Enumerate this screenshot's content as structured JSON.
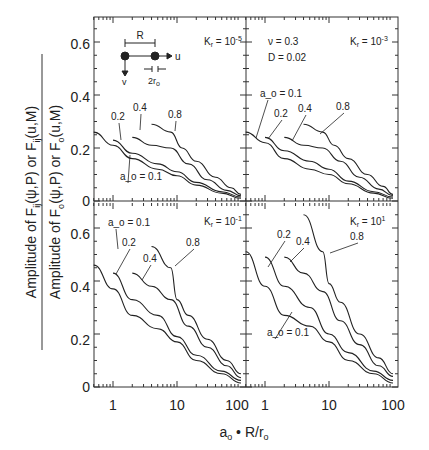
{
  "chart_data": {
    "type": "line",
    "title": "",
    "xlabel": "a_o · R/r_o",
    "ylabel_numerator": "Amplitude of F^v_ij(ψ,P) or F^v_ij(u,M)",
    "ylabel_denominator": "Amplitude of F_o(ψ,P) or F_o(u,M)",
    "x_scale": "log",
    "xlim": [
      0.5,
      100
    ],
    "ylim": [
      0,
      0.7
    ],
    "x_ticks": [
      "1",
      "10",
      "100"
    ],
    "y_ticks": [
      "0",
      "0.2",
      "0.4",
      "0.6"
    ],
    "grid": false,
    "parameters": {
      "nu": "ν = 0.3",
      "D": "D = 0.02"
    },
    "inset": {
      "R": "R",
      "u": "u",
      "v": "v",
      "r": "2r_o"
    },
    "panels": [
      {
        "label": "K_r = 10^-5",
        "series": [
          {
            "name": "a_o = 0.1",
            "x": [
              0.5,
              1,
              2,
              5,
              10,
              20,
              50,
              100
            ],
            "values": [
              0.26,
              0.21,
              0.16,
              0.12,
              0.095,
              0.06,
              0.03,
              0.01
            ]
          },
          {
            "name": "0.2",
            "x": [
              1,
              2,
              5,
              10,
              20,
              50,
              100
            ],
            "values": [
              0.23,
              0.18,
              0.14,
              0.11,
              0.07,
              0.035,
              0.015
            ]
          },
          {
            "name": "0.4",
            "x": [
              2,
              4,
              8,
              15,
              30,
              60,
              100
            ],
            "values": [
              0.24,
              0.21,
              0.2,
              0.14,
              0.08,
              0.04,
              0.02
            ]
          },
          {
            "name": "0.8",
            "x": [
              4,
              8,
              12,
              20,
              40,
              70,
              100
            ],
            "values": [
              0.29,
              0.26,
              0.2,
              0.15,
              0.09,
              0.05,
              0.025
            ]
          }
        ]
      },
      {
        "label": "K_r = 10^-3",
        "series": [
          {
            "name": "a_o = 0.1",
            "x": [
              0.5,
              1,
              2,
              5,
              10,
              20,
              50,
              100
            ],
            "values": [
              0.26,
              0.22,
              0.16,
              0.12,
              0.1,
              0.065,
              0.03,
              0.01
            ]
          },
          {
            "name": "0.2",
            "x": [
              1,
              2,
              5,
              10,
              20,
              50,
              100
            ],
            "values": [
              0.24,
              0.19,
              0.15,
              0.12,
              0.075,
              0.035,
              0.015
            ]
          },
          {
            "name": "0.4",
            "x": [
              2,
              4,
              8,
              15,
              30,
              60,
              100
            ],
            "values": [
              0.24,
              0.21,
              0.2,
              0.15,
              0.09,
              0.045,
              0.02
            ]
          },
          {
            "name": "0.8",
            "x": [
              4,
              8,
              12,
              20,
              40,
              70,
              100
            ],
            "values": [
              0.29,
              0.26,
              0.21,
              0.16,
              0.1,
              0.055,
              0.025
            ]
          }
        ]
      },
      {
        "label": "K_r = 10^-1",
        "series": [
          {
            "name": "a_o = 0.1",
            "x": [
              0.5,
              1,
              2,
              5,
              10,
              20,
              50,
              100
            ],
            "values": [
              0.46,
              0.37,
              0.27,
              0.22,
              0.17,
              0.1,
              0.05,
              0.015
            ]
          },
          {
            "name": "0.2",
            "x": [
              1,
              2,
              5,
              10,
              20,
              50,
              100
            ],
            "values": [
              0.43,
              0.33,
              0.27,
              0.19,
              0.12,
              0.06,
              0.025
            ]
          },
          {
            "name": "0.4",
            "x": [
              2,
              4,
              8,
              15,
              30,
              60,
              100
            ],
            "values": [
              0.43,
              0.38,
              0.33,
              0.23,
              0.15,
              0.08,
              0.035
            ]
          },
          {
            "name": "0.8",
            "x": [
              4,
              8,
              10,
              15,
              30,
              60,
              100
            ],
            "values": [
              0.53,
              0.45,
              0.33,
              0.27,
              0.18,
              0.1,
              0.05
            ]
          }
        ]
      },
      {
        "label": "K_r = 10^1",
        "series": [
          {
            "name": "a_o = 0.1",
            "x": [
              0.5,
              1,
              2,
              5,
              10,
              20,
              50,
              100
            ],
            "values": [
              0.51,
              0.38,
              0.27,
              0.23,
              0.17,
              0.1,
              0.05,
              0.015
            ]
          },
          {
            "name": "0.2",
            "x": [
              1,
              2,
              5,
              10,
              20,
              50,
              100
            ],
            "values": [
              0.49,
              0.38,
              0.3,
              0.2,
              0.13,
              0.06,
              0.025
            ]
          },
          {
            "name": "0.4",
            "x": [
              2,
              4,
              8,
              15,
              30,
              60,
              100
            ],
            "values": [
              0.49,
              0.43,
              0.36,
              0.25,
              0.16,
              0.08,
              0.04
            ]
          },
          {
            "name": "0.8",
            "x": [
              4,
              8,
              10,
              15,
              30,
              60,
              100
            ],
            "values": [
              0.65,
              0.51,
              0.39,
              0.32,
              0.2,
              0.11,
              0.05
            ]
          }
        ]
      }
    ]
  },
  "labels": {
    "p1": "K_r = 10^-5",
    "p2": "K_r = 10^-3",
    "p3": "K_r = 10^-1",
    "p4": "K_r = 10^1",
    "nu": "ν = 0.3",
    "D": "D = 0.02",
    "a01": "a_o = 0.1",
    "a02": "0.2",
    "a04": "0.4",
    "a08": "0.8",
    "R": "R",
    "u": "u",
    "v": "v",
    "r": "2r",
    "xlabel": "a · R/r"
  }
}
